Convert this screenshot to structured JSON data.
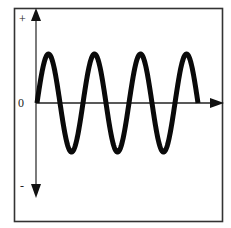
{
  "diagram": {
    "title": "",
    "type": "sine-wave-signal",
    "labels": {
      "plus": "+",
      "zero": "0",
      "minus": "-"
    },
    "colors": {
      "wave": "#0a0a0a",
      "axis": "#333333",
      "frame": "#333333",
      "background": "#ffffff"
    },
    "wave": {
      "cycles": 3.5,
      "starts_at": "zero, rising",
      "ends_at": "zero",
      "amplitude_relative": 1
    }
  }
}
